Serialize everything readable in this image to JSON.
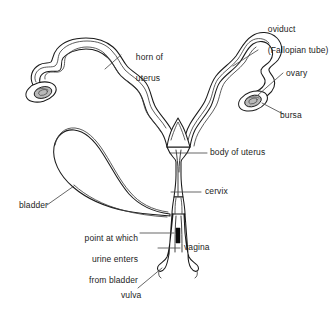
{
  "figure": {
    "background_color": "#ffffff",
    "line_color": "#1a1a1a",
    "ovary_fill_color": "#b9b9b9",
    "urine_point_color": "#0d0d0d",
    "width": 336,
    "height": 322
  },
  "labels": {
    "oviduct": {
      "line1": "oviduct",
      "line2": "(Fallopian tube)"
    },
    "ovary": "ovary",
    "bursa": "bursa",
    "horn_of_uterus": {
      "line1": "horn of",
      "line2": "uterus"
    },
    "body_of_uterus": "body of uterus",
    "cervix": "cervix",
    "bladder": "bladder",
    "urine_point": {
      "line1": "point at which",
      "line2": "urine enters",
      "line3": "from bladder"
    },
    "vagina": "vagina",
    "vulva": "vulva"
  }
}
